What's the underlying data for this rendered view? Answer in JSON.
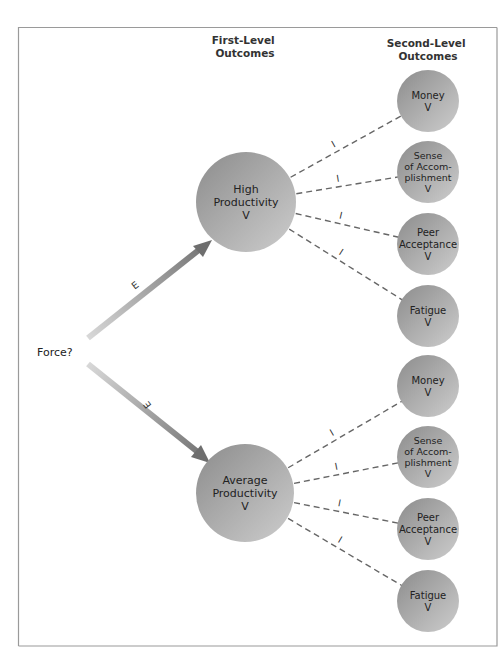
{
  "headers": {
    "first_level": [
      "First-Level",
      "Outcomes"
    ],
    "second_level": [
      "Second-Level",
      "Outcomes"
    ]
  },
  "force_label": "Force?",
  "expectancy_label": "E",
  "instrumentality_label": "I",
  "first_level_outcomes": [
    {
      "id": "high-productivity",
      "lines": [
        "High",
        "Productivity",
        "V"
      ],
      "second_level": [
        {
          "id": "money",
          "lines": [
            "Money",
            "V"
          ]
        },
        {
          "id": "sense-of-accomplishment",
          "lines": [
            "Sense",
            "of Accom-",
            "plishment",
            "V"
          ]
        },
        {
          "id": "peer-acceptance",
          "lines": [
            "Peer",
            "Acceptance",
            "V"
          ]
        },
        {
          "id": "fatigue",
          "lines": [
            "Fatigue",
            "V"
          ]
        }
      ]
    },
    {
      "id": "average-productivity",
      "lines": [
        "Average",
        "Productivity",
        "V"
      ],
      "second_level": [
        {
          "id": "money",
          "lines": [
            "Money",
            "V"
          ]
        },
        {
          "id": "sense-of-accomplishment",
          "lines": [
            "Sense",
            "of Accom-",
            "plishment",
            "V"
          ]
        },
        {
          "id": "peer-acceptance",
          "lines": [
            "Peer",
            "Acceptance",
            "V"
          ]
        },
        {
          "id": "fatigue",
          "lines": [
            "Fatigue",
            "V"
          ]
        }
      ]
    }
  ],
  "colors": {
    "circle_dark": "#8c8c8c",
    "circle_light": "#cdcdcd",
    "arrow_dark": "#6e6e6e",
    "arrow_light": "#d8d8d8",
    "dash": "#666666",
    "frame": "#9a9a9a"
  }
}
